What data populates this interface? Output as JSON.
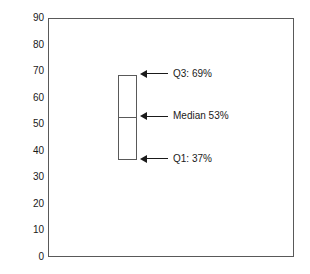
{
  "chart_data": {
    "type": "box",
    "title": "",
    "xlabel": "",
    "ylabel": "Percent of Felony Charges",
    "ylim": [
      0,
      90
    ],
    "ytick_labels": [
      "90",
      "80",
      "70",
      "60",
      "50",
      "40",
      "30",
      "20",
      "10",
      "0"
    ],
    "ytick_values": [
      90,
      80,
      70,
      60,
      50,
      40,
      30,
      20,
      10,
      0
    ],
    "grid": false,
    "legend": false,
    "categories": [
      "Felony Charges"
    ],
    "boxes": [
      {
        "name": "Felony Charges",
        "q1": 37,
        "median": 53,
        "q3": 69,
        "whisker_low": null,
        "whisker_high": null,
        "outliers": []
      }
    ],
    "annotations": [
      {
        "id": "q3",
        "value": 69,
        "label": "Q3: 69%"
      },
      {
        "id": "median",
        "value": 53,
        "label": "Median 53%"
      },
      {
        "id": "q1",
        "value": 37,
        "label": "Q1: 37%"
      }
    ],
    "colors": {
      "background": "#ffffff",
      "frame": "#595959",
      "box_stroke": "#595959",
      "box_fill": "#ffffff",
      "text": "#1a1a1a",
      "annotation_line": "#1a1a1a"
    }
  }
}
